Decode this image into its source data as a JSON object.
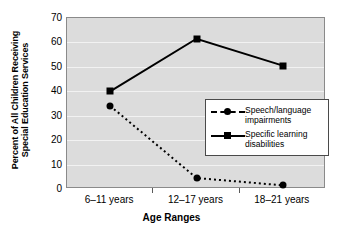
{
  "chart_data": {
    "type": "line",
    "title": "",
    "xlabel": "Age Ranges",
    "ylabel": "Percent of All Children Receiving Special Education Services",
    "ylabel_line1": "Percent of All Children Receiving",
    "ylabel_line2": "Special Education Services",
    "categories": [
      "6–11 years",
      "12–17 years",
      "18–21 years"
    ],
    "yticks": [
      0,
      10,
      20,
      30,
      40,
      50,
      60,
      70
    ],
    "ylim": [
      0,
      70
    ],
    "grid": "horizontal",
    "legend_position": "lower-right",
    "series": [
      {
        "name": "Speech/language impairments",
        "name_line1": "Speech/language",
        "name_line2": "impairments",
        "marker": "circle",
        "linestyle": "dashed",
        "color": "#000000",
        "values": [
          34,
          4.5,
          1.5
        ]
      },
      {
        "name": "Specific learning disabilities",
        "name_line1": "Specific learning",
        "name_line2": "disabilities",
        "marker": "square",
        "linestyle": "solid",
        "color": "#000000",
        "values": [
          40,
          61.5,
          50.5
        ]
      }
    ]
  },
  "style": {
    "plot_background": "#dcdcdc",
    "gridline_color": "#f2f2f2",
    "frame_color": "#8a8a8a",
    "ink_color": "#000000",
    "page_background": "#ffffff"
  }
}
